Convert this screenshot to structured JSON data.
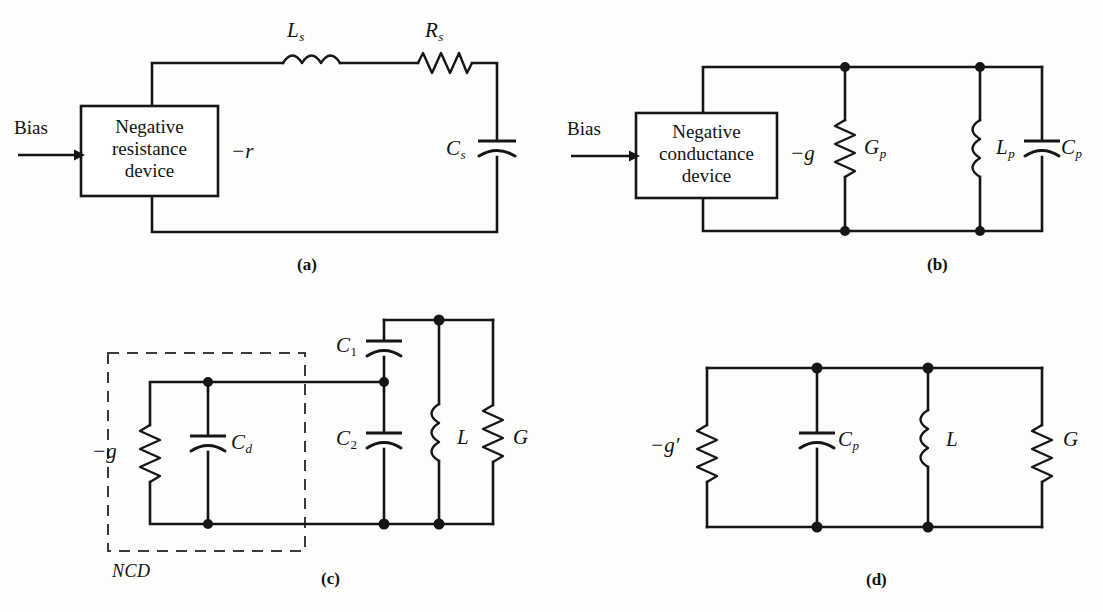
{
  "figure": {
    "line_color": "#161616",
    "background": "#fdfdfc"
  },
  "panels": [
    {
      "id": "a",
      "caption": "(a)",
      "bias_label": "Bias",
      "device_box": {
        "lines": [
          "Negative",
          "resistance",
          "device"
        ]
      },
      "components": [
        {
          "name": "series-inductor",
          "type": "inductor",
          "symbol": "L",
          "subscript": "s",
          "label": "Ls"
        },
        {
          "name": "series-resistor",
          "type": "resistor",
          "symbol": "R",
          "subscript": "s",
          "label": "Rs"
        },
        {
          "name": "series-capacitor",
          "type": "capacitor",
          "symbol": "C",
          "subscript": "s",
          "label": "Cs"
        },
        {
          "name": "negative-resistance",
          "type": "value",
          "symbol": "−r",
          "subscript": "",
          "label": "-r"
        }
      ]
    },
    {
      "id": "b",
      "caption": "(b)",
      "bias_label": "Bias",
      "device_box": {
        "lines": [
          "Negative",
          "conductance",
          "device"
        ]
      },
      "components": [
        {
          "name": "negative-conductance",
          "type": "value",
          "symbol": "−g",
          "subscript": "",
          "label": "-g"
        },
        {
          "name": "parallel-conductance",
          "type": "resistor",
          "symbol": "G",
          "subscript": "p",
          "label": "Gp"
        },
        {
          "name": "parallel-inductor",
          "type": "inductor",
          "symbol": "L",
          "subscript": "p",
          "label": "Lp"
        },
        {
          "name": "parallel-capacitor",
          "type": "capacitor",
          "symbol": "C",
          "subscript": "p",
          "label": "Cp"
        }
      ]
    },
    {
      "id": "c",
      "caption": "(c)",
      "dashed_box_label": "NCD",
      "components": [
        {
          "name": "negative-conductance",
          "type": "resistor",
          "symbol": "−g",
          "subscript": "",
          "label": "-g"
        },
        {
          "name": "device-capacitance",
          "type": "capacitor",
          "symbol": "C",
          "subscript": "d",
          "label": "Cd"
        },
        {
          "name": "capacitor-c1",
          "type": "capacitor",
          "symbol": "C",
          "subscript": "1",
          "label": "C1"
        },
        {
          "name": "capacitor-c2",
          "type": "capacitor",
          "symbol": "C",
          "subscript": "2",
          "label": "C2"
        },
        {
          "name": "inductor-l",
          "type": "inductor",
          "symbol": "L",
          "subscript": "",
          "label": "L"
        },
        {
          "name": "conductance-g",
          "type": "resistor",
          "symbol": "G",
          "subscript": "",
          "label": "G"
        }
      ]
    },
    {
      "id": "d",
      "caption": "(d)",
      "components": [
        {
          "name": "negative-conductance-prime",
          "type": "resistor",
          "symbol": "−g′",
          "subscript": "",
          "label": "-g'"
        },
        {
          "name": "parallel-capacitor",
          "type": "capacitor",
          "symbol": "C",
          "subscript": "p",
          "label": "Cp"
        },
        {
          "name": "inductor-l",
          "type": "inductor",
          "symbol": "L",
          "subscript": "",
          "label": "L"
        },
        {
          "name": "conductance-g",
          "type": "resistor",
          "symbol": "G",
          "subscript": "",
          "label": "G"
        }
      ]
    }
  ],
  "labels": {
    "bias": "Bias",
    "neg_r": "−r",
    "neg_g": "−g",
    "neg_g_prime": "−g′",
    "ncd": "NCD",
    "L": "L",
    "R": "R",
    "C": "C",
    "G": "G",
    "sub_s": "s",
    "sub_p": "p",
    "sub_d": "d",
    "sub_1": "1",
    "sub_2": "2",
    "box_a_l1": "Negative",
    "box_a_l2": "resistance",
    "box_a_l3": "device",
    "box_b_l1": "Negative",
    "box_b_l2": "conductance",
    "box_b_l3": "device",
    "cap_a": "(a)",
    "cap_b": "(b)",
    "cap_c": "(c)",
    "cap_d": "(d)"
  }
}
